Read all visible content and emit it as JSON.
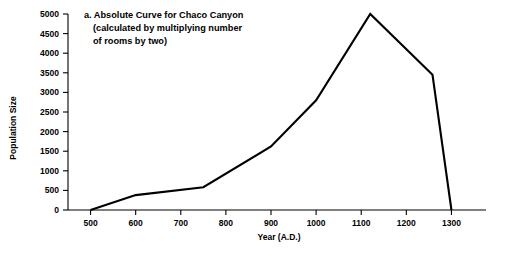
{
  "figure": {
    "label": "a",
    "title_lines": [
      "a. Absolute Curve for Chaco Canyon",
      "(calculated by multiplying number",
      "of rooms by two)"
    ],
    "background_color": "#ffffff",
    "line_color": "#000000"
  },
  "chart_data": {
    "type": "line",
    "title": "a. Absolute Curve for Chaco Canyon (calculated by multiplying number of rooms by two)",
    "xlabel": "Year (A.D.)",
    "ylabel": "Population Size",
    "xlim": [
      450,
      1350
    ],
    "ylim": [
      0,
      5000
    ],
    "grid": false,
    "legend": false,
    "xticks": [
      500,
      600,
      700,
      800,
      900,
      1000,
      1100,
      1200,
      1300
    ],
    "xtick_labels": [
      "500",
      "600",
      "700",
      "800",
      "900",
      "1000",
      "1100",
      "1200",
      "1300"
    ],
    "yticks": [
      0,
      500,
      1000,
      1500,
      2000,
      2500,
      3000,
      3500,
      4000,
      4500,
      5000
    ],
    "ytick_labels": [
      "0",
      "500",
      "1000",
      "1500",
      "2000",
      "2500",
      "3000",
      "3500",
      "4000",
      "4500",
      "5000"
    ],
    "series": [
      {
        "name": "Absolute population curve",
        "x": [
          500,
          600,
          750,
          900,
          1000,
          1120,
          1258,
          1300
        ],
        "y": [
          0,
          380,
          580,
          1620,
          2800,
          5000,
          3450,
          0
        ]
      }
    ]
  }
}
